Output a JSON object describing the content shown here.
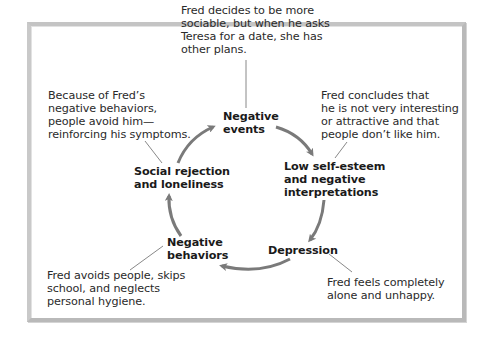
{
  "diagram": {
    "type": "cycle",
    "nodes": [
      {
        "id": "negative-events",
        "label_lines": [
          "Negative",
          "events"
        ]
      },
      {
        "id": "low-self-esteem",
        "label_lines": [
          "Low self-esteem",
          "and negative",
          "interpretations"
        ]
      },
      {
        "id": "depression",
        "label_lines": [
          "Depression"
        ]
      },
      {
        "id": "negative-behaviors",
        "label_lines": [
          "Negative",
          "behaviors"
        ]
      },
      {
        "id": "social-rejection",
        "label_lines": [
          "Social rejection",
          "and loneliness"
        ]
      }
    ],
    "edges": [
      {
        "from": "negative-events",
        "to": "low-self-esteem"
      },
      {
        "from": "low-self-esteem",
        "to": "depression"
      },
      {
        "from": "depression",
        "to": "negative-behaviors"
      },
      {
        "from": "negative-behaviors",
        "to": "social-rejection"
      },
      {
        "from": "social-rejection",
        "to": "negative-events"
      }
    ],
    "annotations": {
      "negative_events": [
        "Fred decides to be more",
        "sociable, but when he asks",
        "Teresa for a date, she has",
        "other plans."
      ],
      "low_self_esteem": [
        "Fred concludes that",
        "he is not very interesting",
        "or attractive and that",
        "people don’t like him."
      ],
      "depression": [
        "Fred feels completely",
        "alone and unhappy."
      ],
      "negative_behaviors": [
        "Fred avoids people, skips",
        "school, and neglects",
        "personal hygiene."
      ],
      "social_rejection": [
        "Because of Fred’s",
        "negative behaviors,",
        "people avoid him—",
        "reinforcing his symptoms."
      ]
    }
  },
  "colors": {
    "arrow": "#7a7a7a",
    "leader_line": "#6a6a6a",
    "frame": "#bdbdbd",
    "text": "#222222"
  }
}
